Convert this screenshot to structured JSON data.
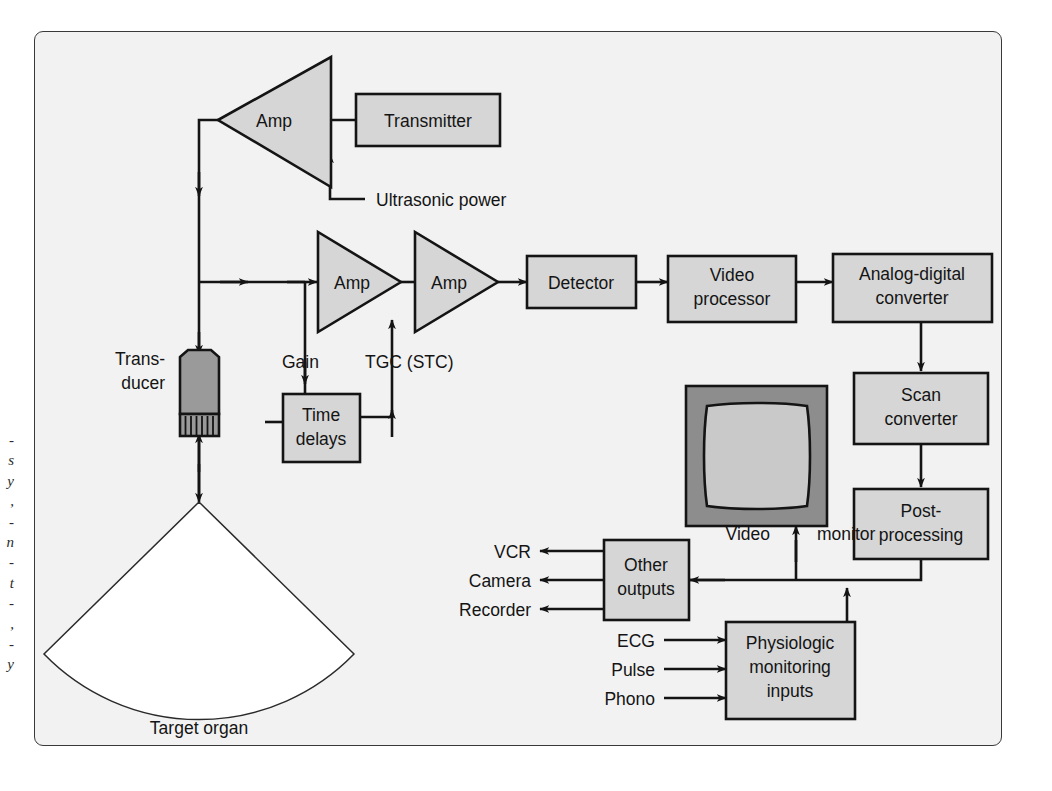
{
  "figure": {
    "kind": "block-diagram",
    "background_color": "#f2f2f2",
    "page_color": "#ffffff",
    "box_fill": "#d6d6d6",
    "line_color": "#141414",
    "monitor_bezel_color": "#8d8d8d",
    "monitor_screen_color": "#c9c9c9",
    "transducer_color": "#9a9a9a",
    "sector_fill": "#ffffff"
  },
  "caption_remnant": "-\ns\ny\n,\n-\nn\n-\nt\n-\n,\n-\ny",
  "blocks": {
    "transmitter": "Transmitter",
    "detector": "Detector",
    "video_processor": "Video\nprocessor",
    "adc": "Analog-digital\nconverter",
    "scan_converter": "Scan\nconverter",
    "post_processing": "Post-\nprocessing",
    "time_delays": "Time\ndelays",
    "other_outputs": "Other\noutputs",
    "physiologic": "Physiologic\nmonitoring\ninputs"
  },
  "amplifiers": [
    {
      "label": "Amp",
      "role": "transmit-power-amplifier"
    },
    {
      "label": "Amp",
      "role": "receive-preamplifier"
    },
    {
      "label": "Amp",
      "role": "tgc-amplifier"
    }
  ],
  "labels": {
    "ultrasonic_power": "Ultrasonic power",
    "gain": "Gain",
    "tgc": "TGC (STC)",
    "transducer": "Trans-\nducer",
    "transducer_line1": "Trans-",
    "transducer_line2": "ducer",
    "target_organ": "Target organ",
    "video": "Video",
    "monitor": "monitor"
  },
  "outputs": [
    "VCR",
    "Camera",
    "Recorder"
  ],
  "inputs": [
    "ECG",
    "Pulse",
    "Phono"
  ],
  "icons": {
    "transducer": "transducer-probe-icon",
    "monitor": "crt-monitor-icon",
    "sector": "ultrasound-sector-scan-icon",
    "arrow": "arrowhead-icon"
  }
}
